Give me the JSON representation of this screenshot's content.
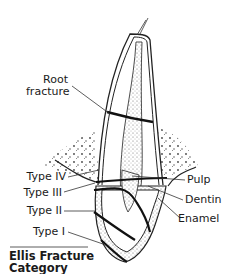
{
  "diagram": {
    "title_line1": "Ellis Fracture",
    "title_line2": "Category",
    "labels": {
      "root_fracture_1": "Root",
      "root_fracture_2": "fracture",
      "type_iv": "Type IV",
      "type_iii": "Type III",
      "type_ii": "Type II",
      "type_i": "Type I",
      "pulp": "Pulp",
      "dentin": "Dentin",
      "enamel": "Enamel"
    }
  }
}
